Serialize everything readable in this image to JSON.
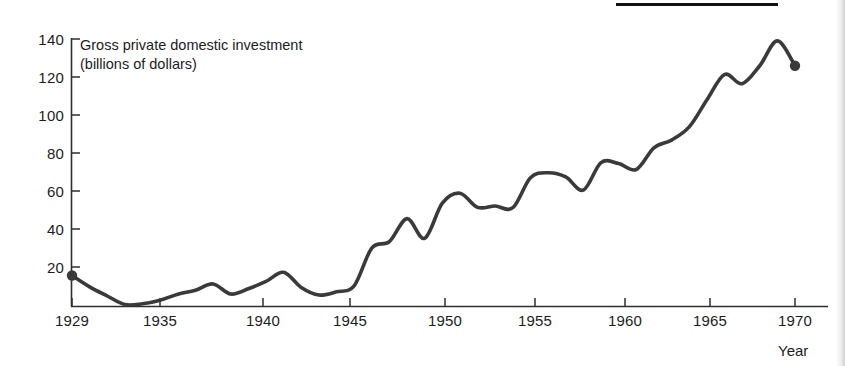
{
  "figure": {
    "background_color": "#ffffff",
    "ink_color": "#2e2e2e",
    "rule_color": "#111111",
    "top_rule_label": "page-rule"
  },
  "chart_data": {
    "type": "line",
    "title": "Gross private domestic investment",
    "subtitle": "(billions of dollars)",
    "xlabel": "Year",
    "ylabel": "",
    "xlim": [
      1929,
      1971
    ],
    "ylim": [
      0,
      140
    ],
    "grid": false,
    "legend": false,
    "x_ticks": [
      1929,
      1935,
      1940,
      1945,
      1950,
      1955,
      1960,
      1965,
      1970
    ],
    "x_tick_labels": [
      "1929",
      "1935",
      "1940",
      "1945",
      "1950",
      "1955",
      "1960",
      "1965",
      "1970"
    ],
    "y_ticks": [
      0,
      20,
      40,
      60,
      80,
      100,
      120,
      140
    ],
    "y_tick_labels": [
      "",
      "20",
      "40",
      "60",
      "80",
      "100",
      "120",
      "140"
    ],
    "markers": [
      {
        "name": "start-point",
        "x": 1929,
        "y": 16.2
      },
      {
        "name": "end-point",
        "x": 1970,
        "y": 126.0
      }
    ],
    "series": [
      {
        "name": "Gross private domestic investment",
        "color": "#3a3a3a",
        "line_width": 3.6,
        "x": [
          1929,
          1930,
          1931,
          1932,
          1933,
          1934,
          1935,
          1936,
          1937,
          1938,
          1939,
          1940,
          1941,
          1942,
          1943,
          1944,
          1945,
          1946,
          1947,
          1948,
          1949,
          1950,
          1951,
          1952,
          1953,
          1954,
          1955,
          1956,
          1957,
          1958,
          1959,
          1960,
          1961,
          1962,
          1963,
          1964,
          1965,
          1966,
          1967,
          1968,
          1969,
          1970
        ],
        "y": [
          16.2,
          10.3,
          5.5,
          1.0,
          1.4,
          3.3,
          6.4,
          8.5,
          11.8,
          6.5,
          9.3,
          13.1,
          17.9,
          10.0,
          6.0,
          7.7,
          10.8,
          30.6,
          34.0,
          46.0,
          35.7,
          54.1,
          59.3,
          51.9,
          52.6,
          51.7,
          67.4,
          70.0,
          67.8,
          60.9,
          75.3,
          74.8,
          71.7,
          83.0,
          87.1,
          94.0,
          108.1,
          121.4,
          116.6,
          126.0,
          139.0,
          126.0
        ],
        "y_estimated_from": "axis gridlines"
      }
    ],
    "annotations": []
  },
  "axes": {
    "x_axis_name": "year-axis",
    "y_axis_name": "investment-axis"
  }
}
